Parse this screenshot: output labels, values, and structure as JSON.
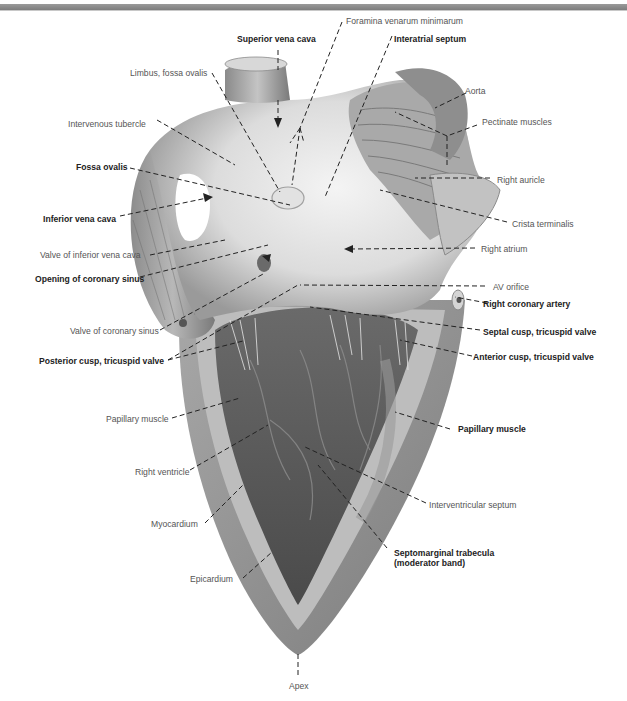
{
  "figure": {
    "colors": {
      "label_regular": "#555555",
      "label_bold": "#222222",
      "leader_line": "#222222",
      "top_bar": "#8a8a8a"
    }
  },
  "labels": {
    "foramina_venarum_minimarum": "Foramina venarum minimarum",
    "superior_vena_cava": "Superior vena cava",
    "interatrial_septum": "Interatrial septum",
    "limbus_fossa_ovalis": "Limbus, fossa ovalis",
    "aorta": "Aorta",
    "intervenous_tubercle": "Intervenous tubercle",
    "pectinate_muscles": "Pectinate muscles",
    "fossa_ovalis": "Fossa ovalis",
    "right_auricle": "Right auricle",
    "inferior_vena_cava": "Inferior vena cava",
    "crista_terminalis": "Crista terminalis",
    "valve_of_inferior_vena_cava": "Valve of inferior vena cava",
    "right_atrium": "Right atrium",
    "opening_of_coronary_sinus": "Opening of coronary sinus",
    "av_orifice": "AV orifice",
    "right_coronary_artery": "Right coronary artery",
    "valve_of_coronary_sinus": "Valve of coronary sinus",
    "septal_cusp": "Septal cusp, tricuspid valve",
    "posterior_cusp": "Posterior cusp, tricuspid valve",
    "anterior_cusp": "Anterior cusp, tricuspid valve",
    "papillary_muscle_left": "Papillary muscle",
    "papillary_muscle_right": "Papillary muscle",
    "right_ventricle": "Right ventricle",
    "interventricular_septum": "Interventricular septum",
    "myocardium": "Myocardium",
    "septomarginal_trabecula": "Septomarginal trabecula\n(moderator band)",
    "epicardium": "Epicardium",
    "apex": "Apex"
  }
}
